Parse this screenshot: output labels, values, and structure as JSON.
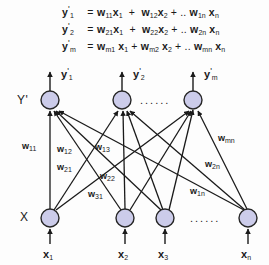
{
  "equations": [
    {
      "lhs": "y'1",
      "lhs_base": "y",
      "lhs_sub": "1",
      "eq": "=",
      "rhs": "w11 x1  +  w12 x2 + .. w1n xn",
      "terms": [
        {
          "w": "w",
          "w_sub": "11",
          "x": "x",
          "x_sub": "1"
        },
        {
          "w": "w",
          "w_sub": "12",
          "x": "x",
          "x_sub": "2"
        },
        {
          "w": "w",
          "w_sub": "1n",
          "x": "x",
          "x_sub": "n"
        }
      ]
    },
    {
      "lhs": "y'2",
      "lhs_base": "y",
      "lhs_sub": "2",
      "eq": "=",
      "rhs": "w21 x1  +  w22 x2 + .. w2n xn",
      "terms": [
        {
          "w": "w",
          "w_sub": "21",
          "x": "x",
          "x_sub": "1"
        },
        {
          "w": "w",
          "w_sub": "22",
          "x": "x",
          "x_sub": "2"
        },
        {
          "w": "w",
          "w_sub": "2n",
          "x": "x",
          "x_sub": "n"
        }
      ]
    },
    {
      "lhs": "y'm",
      "lhs_base": "y",
      "lhs_sub": "m",
      "eq": "=",
      "rhs": "wm1 x1 + wm2 x2 + .. wmn xn",
      "terms": [
        {
          "w": "w",
          "w_sub": "m1",
          "x": "x",
          "x_sub": "1"
        },
        {
          "w": "w",
          "w_sub": "m2",
          "x": "x",
          "x_sub": "2"
        },
        {
          "w": "w",
          "w_sub": "mn",
          "x": "x",
          "x_sub": "n"
        }
      ]
    }
  ],
  "eq_symbols": {
    "plus": "+",
    "ellipsis": "..",
    "equals": "="
  },
  "layers": {
    "output_label": "Y'",
    "input_label": "X"
  },
  "output_nodes": [
    {
      "id": "y1",
      "label_base": "y",
      "label_sub": "1",
      "cx": 50,
      "cy": 42
    },
    {
      "id": "y2",
      "label_base": "y",
      "label_sub": "2",
      "cx": 122,
      "cy": 42
    },
    {
      "id": "ym",
      "label_base": "y",
      "label_sub": "m",
      "cx": 193,
      "cy": 42
    }
  ],
  "input_nodes": [
    {
      "id": "x1",
      "label_base": "x",
      "label_sub": "1",
      "cx": 50,
      "cy": 160
    },
    {
      "id": "x2",
      "label_base": "x",
      "label_sub": "2",
      "cx": 125,
      "cy": 160
    },
    {
      "id": "x3",
      "label_base": "x",
      "label_sub": "3",
      "cx": 165,
      "cy": 160
    },
    {
      "id": "xn",
      "label_base": "x",
      "label_sub": "n",
      "cx": 248,
      "cy": 160
    }
  ],
  "weight_labels": [
    {
      "text_base": "w",
      "text_sub": "11",
      "x": 22,
      "y": 83
    },
    {
      "text_base": "w",
      "text_sub": "12",
      "x": 57,
      "y": 86
    },
    {
      "text_base": "w",
      "text_sub": "13",
      "x": 95,
      "y": 84
    },
    {
      "text_base": "w",
      "text_sub": "21",
      "x": 57,
      "y": 104
    },
    {
      "text_base": "w",
      "text_sub": "22",
      "x": 100,
      "y": 113
    },
    {
      "text_base": "w",
      "text_sub": "31",
      "x": 88,
      "y": 131
    },
    {
      "text_base": "w",
      "text_sub": "mn",
      "x": 218,
      "y": 75
    },
    {
      "text_base": "w",
      "text_sub": "2n",
      "x": 205,
      "y": 101
    },
    {
      "text_base": "w",
      "text_sub": "1n",
      "x": 190,
      "y": 128
    }
  ],
  "ellipsis_marks": [
    {
      "name": "output-layer-ellipsis",
      "text": "......",
      "x": 140,
      "y": 36
    },
    {
      "name": "input-layer-ellipsis",
      "text": "......",
      "x": 190,
      "y": 154
    }
  ],
  "colors": {
    "node_fill": "#ccccea",
    "node_stroke": "#262626",
    "edge": "#1a1a1a",
    "text": "#1a1a1a",
    "background": "#fdfdfd"
  },
  "geometry": {
    "node_radius": 9,
    "output_row_y": 42,
    "input_row_y": 160
  }
}
